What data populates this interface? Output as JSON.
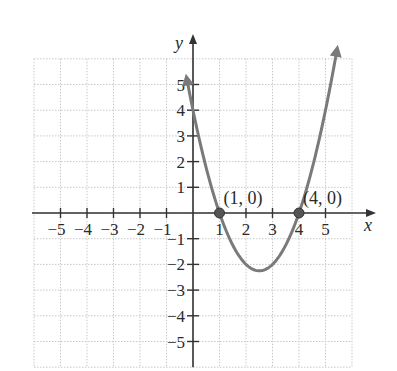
{
  "chart_data": {
    "type": "line",
    "title": "",
    "function": "y = x^2 - 5x + 4",
    "xlabel": "x",
    "ylabel": "y",
    "xlim": [
      -6,
      6
    ],
    "ylim": [
      -6,
      6
    ],
    "grid": true,
    "legend": null,
    "x_ticks": [
      -5,
      -4,
      -3,
      -2,
      -1,
      1,
      2,
      3,
      4,
      5
    ],
    "y_ticks": [
      -5,
      -4,
      -3,
      -2,
      -1,
      1,
      2,
      3,
      4,
      5
    ],
    "x_tick_labels": [
      "−5",
      "−4",
      "−3",
      "−2",
      "−1",
      "1",
      "2",
      "3",
      "4",
      "5"
    ],
    "y_tick_labels": [
      "−5",
      "−4",
      "−3",
      "−2",
      "−1",
      "1",
      "2",
      "3",
      "4",
      "5"
    ],
    "series": [
      {
        "name": "parabola",
        "x": [
          -0.3,
          0,
          0.5,
          1,
          1.5,
          2,
          2.5,
          3,
          3.5,
          4,
          4.5,
          5,
          5.5
        ],
        "y": [
          5.59,
          4,
          1.75,
          0,
          -1.25,
          -2,
          -2.25,
          -2,
          -1.25,
          0,
          1.75,
          4,
          6.75
        ],
        "color": "#7a7a7a",
        "arrows_on_ends": true
      }
    ],
    "points": [
      {
        "x": 1,
        "y": 0,
        "label": "(1, 0)"
      },
      {
        "x": 4,
        "y": 0,
        "label": "(4, 0)"
      }
    ],
    "vertex": {
      "x": 2.5,
      "y": -2.25
    },
    "colors": {
      "axis": "#333333",
      "curve": "#7a7a7a",
      "grid": "#c8c8c8",
      "point": "#555555"
    }
  }
}
